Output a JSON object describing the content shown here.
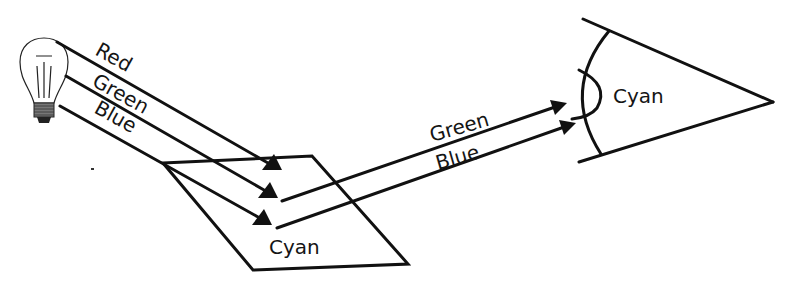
{
  "diagram": {
    "source": {
      "type": "light-bulb",
      "icon": "light-bulb-icon"
    },
    "incident_rays": [
      {
        "label": "Red",
        "absorbed": true
      },
      {
        "label": "Green",
        "absorbed": false
      },
      {
        "label": "Blue",
        "absorbed": false
      }
    ],
    "surface": {
      "label": "Cyan"
    },
    "reflected_rays": [
      {
        "label": "Green"
      },
      {
        "label": "Blue"
      }
    ],
    "observer": {
      "type": "eye",
      "icon": "eye-icon",
      "perceived_label": "Cyan"
    }
  }
}
